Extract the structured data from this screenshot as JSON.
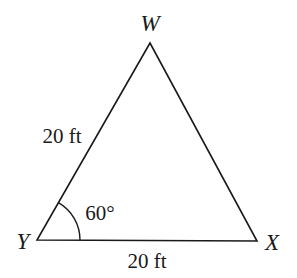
{
  "diagram": {
    "type": "triangle",
    "vertices": [
      {
        "name": "W",
        "label": "W",
        "x": 150,
        "y": 43
      },
      {
        "name": "Y",
        "label": "Y",
        "x": 37,
        "y": 240
      },
      {
        "name": "X",
        "label": "X",
        "x": 257,
        "y": 241
      }
    ],
    "sides": [
      {
        "from": "Y",
        "to": "W",
        "label": "20 ft"
      },
      {
        "from": "Y",
        "to": "X",
        "label": "20 ft"
      },
      {
        "from": "W",
        "to": "X",
        "label": ""
      }
    ],
    "angles": [
      {
        "vertex": "Y",
        "label": "60°"
      }
    ],
    "colors": {
      "stroke": "#1a1a1a",
      "background": "#ffffff"
    }
  }
}
